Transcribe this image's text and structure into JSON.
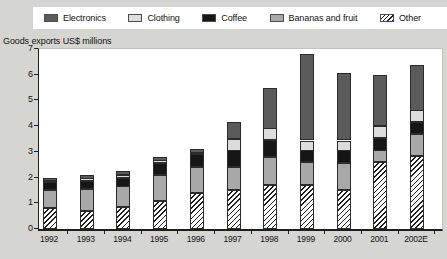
{
  "colors": {
    "page_background": "#d5d5d1",
    "plot_background": "#ffffff",
    "axis": "#1e1e1e",
    "electronics": "#5b5b5b",
    "clothing": "#dcdcdc",
    "coffee": "#161616",
    "bananas_and_fruit": "#a8a8a8",
    "other_hatch": "#1e1e1e"
  },
  "legend": {
    "items": [
      {
        "label": "Electronics",
        "color": "#5b5b5b",
        "pattern": "solid"
      },
      {
        "label": "Clothing",
        "color": "#dcdcdc",
        "pattern": "solid"
      },
      {
        "label": "Coffee",
        "color": "#161616",
        "pattern": "solid"
      },
      {
        "label": "Bananas and fruit",
        "color": "#a8a8a8",
        "pattern": "solid"
      },
      {
        "label": "Other",
        "color": "#ffffff",
        "pattern": "hatch"
      }
    ]
  },
  "chart_data": {
    "type": "bar",
    "stacked": true,
    "title": "",
    "ylabel": "Goods exports US$ millions",
    "xlabel": "",
    "ylim": [
      0,
      7
    ],
    "ytick_values": [
      0,
      1,
      2,
      3,
      4,
      5,
      6,
      7
    ],
    "grid": false,
    "legend_position": "top",
    "categories": [
      "1992",
      "1993",
      "1994",
      "1995",
      "1996",
      "1997",
      "1998",
      "1999",
      "2000",
      "2001",
      "2002E"
    ],
    "stack_order_bottom_to_top": [
      "Other",
      "Bananas and fruit",
      "Coffee",
      "Clothing",
      "Electronics"
    ],
    "series": [
      {
        "name": "Electronics",
        "color": "#5b5b5b",
        "pattern": "solid",
        "values": [
          0.1,
          0.15,
          0.15,
          0.15,
          0.15,
          0.65,
          1.6,
          3.35,
          2.6,
          2.0,
          1.8
        ]
      },
      {
        "name": "Clothing",
        "color": "#dcdcdc",
        "pattern": "solid",
        "values": [
          0.05,
          0.1,
          0.1,
          0.1,
          0.05,
          0.45,
          0.45,
          0.4,
          0.4,
          0.45,
          0.45
        ]
      },
      {
        "name": "Coffee",
        "color": "#161616",
        "pattern": "solid",
        "values": [
          0.3,
          0.3,
          0.35,
          0.45,
          0.5,
          0.65,
          0.65,
          0.45,
          0.5,
          0.5,
          0.45
        ]
      },
      {
        "name": "Bananas and fruit",
        "color": "#a8a8a8",
        "pattern": "solid",
        "values": [
          0.7,
          0.85,
          0.8,
          1.0,
          1.0,
          0.9,
          1.1,
          0.9,
          1.05,
          0.45,
          0.85
        ]
      },
      {
        "name": "Other",
        "color": "#ffffff",
        "pattern": "hatch",
        "values": [
          0.8,
          0.7,
          0.85,
          1.1,
          1.4,
          1.5,
          1.7,
          1.7,
          1.5,
          2.6,
          2.85
        ]
      }
    ],
    "totals": [
      1.95,
      2.1,
      2.25,
      2.8,
      3.1,
      4.15,
      5.5,
      6.8,
      6.05,
      6.0,
      6.4
    ]
  }
}
